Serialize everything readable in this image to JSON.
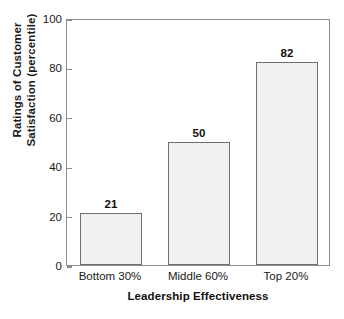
{
  "chart_data": {
    "type": "bar",
    "title": "",
    "subtitle": "",
    "categories": [
      "Bottom 30%",
      "Middle 60%",
      "Top 20%"
    ],
    "values": [
      21,
      50,
      82
    ],
    "data_labels": [
      "21",
      "50",
      "82"
    ],
    "xlabel": "Leadership Effectiveness",
    "ylabel_line1": "Ratings of Customer",
    "ylabel_line2": "Satisfaction (percentile)",
    "ylim": [
      0,
      100
    ],
    "yticks": [
      0,
      20,
      40,
      60,
      80,
      100
    ],
    "ytick_labels": [
      "0",
      "20",
      "40",
      "60",
      "80",
      "100"
    ],
    "grid": false,
    "legend": null,
    "legend_position": "none",
    "colors": {
      "bar_fill": "#f1f1f1",
      "bar_edge": "#6f6f6f",
      "axis": "#8c8c8c",
      "text": "#1a1a1a",
      "background": "#ffffff"
    }
  }
}
